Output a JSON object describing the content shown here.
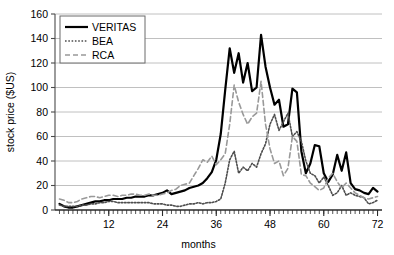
{
  "chart_data": {
    "type": "line",
    "title": "",
    "xlabel": "months",
    "ylabel": "stock price ($US)",
    "xlim": [
      0,
      73
    ],
    "ylim": [
      0,
      160
    ],
    "xticks": [
      12,
      24,
      36,
      48,
      60,
      72
    ],
    "yticks": [
      0,
      20,
      40,
      60,
      80,
      100,
      120,
      140,
      160
    ],
    "grid": "horizontal",
    "legend_position": "top-left",
    "x": [
      1,
      2,
      3,
      4,
      5,
      6,
      7,
      8,
      9,
      10,
      11,
      12,
      13,
      14,
      15,
      16,
      17,
      18,
      19,
      20,
      21,
      22,
      23,
      24,
      25,
      26,
      27,
      28,
      29,
      30,
      31,
      32,
      33,
      34,
      35,
      36,
      37,
      38,
      39,
      40,
      41,
      42,
      43,
      44,
      45,
      46,
      47,
      48,
      49,
      50,
      51,
      52,
      53,
      54,
      55,
      56,
      57,
      58,
      59,
      60,
      61,
      62,
      63,
      64,
      65,
      66,
      67,
      68,
      69,
      70,
      71,
      72
    ],
    "series": [
      {
        "name": "VERITAS",
        "style": "solid",
        "color": "#000000",
        "width": 2.2,
        "values": [
          5,
          3,
          2,
          2,
          3,
          4,
          5,
          6,
          7,
          7,
          8,
          8,
          9,
          9,
          9,
          10,
          10,
          11,
          11,
          11,
          12,
          12,
          13,
          14,
          16,
          13,
          14,
          15,
          16,
          18,
          19,
          20,
          22,
          26,
          31,
          41,
          62,
          98,
          132,
          112,
          128,
          104,
          120,
          97,
          100,
          143,
          117,
          100,
          86,
          90,
          68,
          70,
          99,
          96,
          48,
          30,
          38,
          53,
          52,
          30,
          23,
          29,
          45,
          32,
          47,
          22,
          17,
          16,
          14,
          13,
          18,
          15
        ]
      },
      {
        "name": "BEA",
        "style": "dotted",
        "color": "#4d4d4d",
        "width": 1.6,
        "values": [
          4,
          3,
          3,
          3,
          3,
          4,
          4,
          5,
          5,
          6,
          6,
          7,
          7,
          6,
          6,
          6,
          6,
          6,
          6,
          6,
          6,
          5,
          5,
          5,
          4,
          4,
          3,
          3,
          4,
          5,
          5,
          6,
          5,
          6,
          6,
          7,
          9,
          22,
          41,
          48,
          30,
          35,
          32,
          38,
          35,
          46,
          54,
          70,
          78,
          65,
          72,
          79,
          60,
          64,
          56,
          40,
          30,
          28,
          22,
          27,
          20,
          12,
          14,
          20,
          12,
          14,
          12,
          11,
          10,
          5,
          6,
          8
        ]
      },
      {
        "name": "RCA",
        "style": "dashed",
        "color": "#999999",
        "width": 1.6,
        "values": [
          9,
          8,
          6,
          6,
          7,
          9,
          10,
          11,
          11,
          10,
          11,
          12,
          12,
          11,
          12,
          12,
          13,
          13,
          12,
          12,
          13,
          12,
          12,
          13,
          14,
          16,
          17,
          20,
          21,
          22,
          28,
          34,
          41,
          39,
          44,
          37,
          41,
          46,
          70,
          102,
          88,
          78,
          70,
          76,
          79,
          105,
          70,
          50,
          38,
          40,
          28,
          34,
          60,
          56,
          29,
          28,
          22,
          19,
          16,
          18,
          26,
          30,
          23,
          18,
          22,
          18,
          14,
          12,
          10,
          9,
          10,
          11
        ]
      }
    ]
  },
  "legend": {
    "items": [
      {
        "label": "VERITAS"
      },
      {
        "label": "BEA"
      },
      {
        "label": "RCA"
      }
    ]
  },
  "axes": {
    "x_title": "months",
    "y_title": "stock price ($US)",
    "x_tick_labels": [
      "12",
      "24",
      "36",
      "48",
      "60",
      "72"
    ],
    "y_tick_labels": [
      "0",
      "20",
      "40",
      "60",
      "80",
      "100",
      "120",
      "140",
      "160"
    ]
  }
}
